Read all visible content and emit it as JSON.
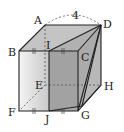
{
  "diagram": {
    "labels": {
      "A": "A",
      "B": "B",
      "C": "C",
      "D": "D",
      "E": "E",
      "F": "F",
      "G": "G",
      "H": "H",
      "I": "I",
      "J": "J"
    },
    "edge_length": "4",
    "tick_mark": "‖"
  }
}
